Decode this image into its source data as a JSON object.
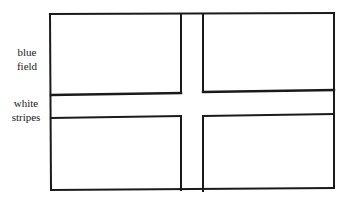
{
  "diagram": {
    "type": "flag-schematic",
    "labels": {
      "blue_field": [
        "blue",
        "field"
      ],
      "white_stripes": [
        "white",
        "stripes"
      ]
    },
    "colors": {
      "line": "#1a1a1a",
      "background": "#ffffff"
    },
    "geometry": {
      "outer": {
        "left": 50,
        "top": 14,
        "right": 334,
        "bottom": 190
      },
      "vertical_stripe": {
        "x1": 181,
        "x2": 203
      },
      "horizontal_stripe_left": {
        "y1": 94,
        "y2": 117
      },
      "horizontal_stripe_right": {
        "y1": 91,
        "y2": 114
      }
    }
  }
}
